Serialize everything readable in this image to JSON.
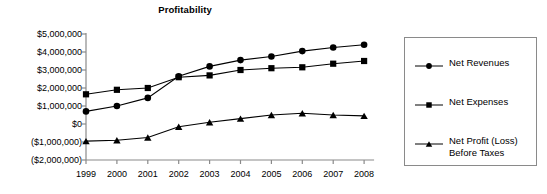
{
  "chart_data": {
    "type": "line",
    "title": "Profitability",
    "xlabel": "",
    "ylabel": "",
    "grid": false,
    "legend_position": "right",
    "categories": [
      "1999",
      "2000",
      "2001",
      "2002",
      "2003",
      "2004",
      "2005",
      "2006",
      "2007",
      "2008"
    ],
    "ylim": [
      -2000000,
      5000000
    ],
    "ytick_values": [
      5000000,
      4000000,
      3000000,
      2000000,
      1000000,
      0,
      -1000000,
      -2000000
    ],
    "ytick_labels": [
      "$5,000,000",
      "$4,000,000",
      "$3,000,000",
      "$2,000,000",
      "$1,000,000",
      "$0",
      "($1,000,000)",
      "($2,000,000)"
    ],
    "series": [
      {
        "name": "Net Revenues",
        "marker": "circle",
        "color": "#000000",
        "values": [
          700000,
          1000000,
          1450000,
          2650000,
          3200000,
          3550000,
          3750000,
          4050000,
          4250000,
          4400000
        ]
      },
      {
        "name": "Net Expenses",
        "marker": "square",
        "color": "#000000",
        "values": [
          1650000,
          1900000,
          2000000,
          2600000,
          2700000,
          3000000,
          3100000,
          3150000,
          3350000,
          3500000
        ]
      },
      {
        "name": "Net Profit (Loss)\nBefore Taxes",
        "marker": "triangle",
        "color": "#000000",
        "values": [
          -950000,
          -900000,
          -750000,
          -150000,
          100000,
          300000,
          500000,
          600000,
          500000,
          450000
        ]
      }
    ]
  },
  "legend": {
    "items": [
      {
        "label": "Net Revenues",
        "marker": "circle"
      },
      {
        "label": "Net Expenses",
        "marker": "square"
      },
      {
        "label": "Net Profit (Loss)\nBefore Taxes",
        "marker": "triangle"
      }
    ]
  },
  "colors": {
    "axis": "#8a8a8a",
    "series": "#000000",
    "legend_border": "#8a8a8a",
    "background": "#ffffff"
  }
}
